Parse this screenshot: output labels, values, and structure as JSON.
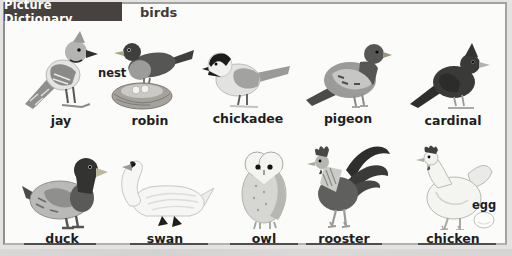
{
  "header": {
    "title": "Picture Dictionary",
    "category": "birds"
  },
  "colors": {
    "badge_bg": "#474140",
    "badge_text": "#ffffff",
    "panel_bg": "#fbfbfa",
    "panel_border": "#a2a2a0",
    "page_bg": "#e4e3e1",
    "label_text": "#1e1e1e"
  },
  "items": [
    {
      "id": "jay",
      "label": "jay"
    },
    {
      "id": "robin",
      "label": "robin",
      "annotation": "nest"
    },
    {
      "id": "chickadee",
      "label": "chickadee"
    },
    {
      "id": "pigeon",
      "label": "pigeon"
    },
    {
      "id": "cardinal",
      "label": "cardinal"
    },
    {
      "id": "duck",
      "label": "duck"
    },
    {
      "id": "swan",
      "label": "swan"
    },
    {
      "id": "owl",
      "label": "owl"
    },
    {
      "id": "rooster",
      "label": "rooster"
    },
    {
      "id": "chicken",
      "label": "chicken",
      "annotation": "egg"
    }
  ]
}
